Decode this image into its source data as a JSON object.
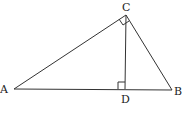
{
  "diagram": {
    "type": "right-triangle-with-altitude",
    "points": {
      "A": {
        "label": "A",
        "x": 14,
        "y": 89
      },
      "B": {
        "label": "B",
        "x": 172,
        "y": 90
      },
      "C": {
        "label": "C",
        "x": 126,
        "y": 15
      },
      "D": {
        "label": "D",
        "x": 125,
        "y": 89
      }
    },
    "segments": [
      "AB",
      "AC",
      "BC",
      "CD"
    ],
    "right_angles": [
      "ACB",
      "CDB"
    ]
  }
}
